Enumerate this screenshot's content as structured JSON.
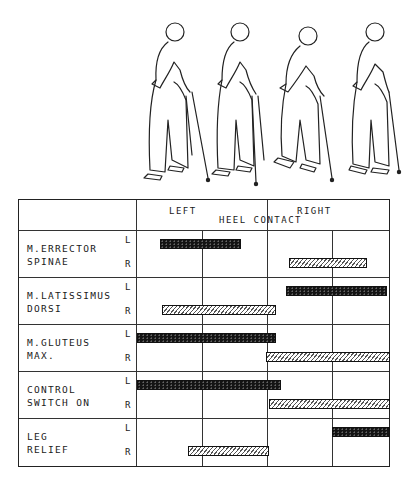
{
  "figure": {
    "figure_count": 4
  },
  "header": {
    "left_label": "LEFT",
    "right_label": "RIGHT",
    "center_label": "HEEL CONTACT"
  },
  "side_labels": {
    "left": "L",
    "right": "R"
  },
  "legend": {
    "solid": "Left side activity (black bar)",
    "hatched": "Right side activity (hatched bar)"
  },
  "rows": [
    {
      "label": "M.ERRECTOR\nSPINAE",
      "left": [
        9,
        41
      ],
      "right": [
        60,
        91
      ]
    },
    {
      "label": "M.LATISSIMUS\nDORSI",
      "left": [
        59,
        99
      ],
      "right": [
        10,
        55
      ]
    },
    {
      "label": "M.GLUTEUS\nMAX.",
      "left": [
        0,
        55
      ],
      "right": [
        51,
        100
      ]
    },
    {
      "label": "CONTROL\nSWITCH ON",
      "left": [
        0,
        57
      ],
      "right": [
        52,
        100
      ]
    },
    {
      "label": "LEG\nRELIEF",
      "left": [
        77,
        100
      ],
      "right": [
        20,
        52
      ]
    }
  ],
  "chart_data": {
    "type": "table",
    "xlabel": "Gait cycle (% from left heel contact to next left heel contact)",
    "x_ticks": [
      "LEFT HEEL CONTACT (0%)",
      "25%",
      "RIGHT HEEL CONTACT (50%)",
      "75%",
      "100%"
    ],
    "series": [
      {
        "name": "M.ERRECTOR SPINAE L",
        "start": 9,
        "end": 41
      },
      {
        "name": "M.ERRECTOR SPINAE R",
        "start": 60,
        "end": 91
      },
      {
        "name": "M.LATISSIMUS DORSI L",
        "start": 59,
        "end": 99
      },
      {
        "name": "M.LATISSIMUS DORSI R",
        "start": 10,
        "end": 55
      },
      {
        "name": "M.GLUTEUS MAX. L",
        "start": 0,
        "end": 55
      },
      {
        "name": "M.GLUTEUS MAX. R",
        "start": 51,
        "end": 100
      },
      {
        "name": "CONTROL SWITCH ON L",
        "start": 0,
        "end": 57
      },
      {
        "name": "CONTROL SWITCH ON R",
        "start": 52,
        "end": 100
      },
      {
        "name": "LEG RELIEF L",
        "start": 77,
        "end": 100
      },
      {
        "name": "LEG RELIEF R",
        "start": 20,
        "end": 52
      }
    ],
    "xlim": [
      0,
      100
    ]
  }
}
